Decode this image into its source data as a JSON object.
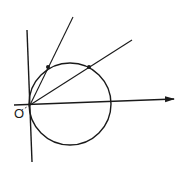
{
  "diagram": {
    "title": "",
    "stroke_color": "#1a1a1a",
    "labels": {
      "origin": "O"
    },
    "circle": {
      "cx": 70,
      "cy": 104,
      "r": 41
    },
    "axis_arrow": {
      "x1": 14,
      "y1": 105,
      "x2": 174,
      "y2": 99
    },
    "vertical_line": {
      "x1": 27,
      "y1": 30,
      "x2": 32,
      "y2": 162
    },
    "steep_line": {
      "x1": 30,
      "y1": 105,
      "x2": 73,
      "y2": 17
    },
    "shallow_line": {
      "x1": 30,
      "y1": 105,
      "x2": 132,
      "y2": 40
    },
    "points": [
      {
        "name": "intersection-steep",
        "x": 48,
        "y": 67
      },
      {
        "name": "intersection-shallow",
        "x": 89,
        "y": 67
      }
    ],
    "origin_point": {
      "x": 30,
      "y": 105
    }
  }
}
